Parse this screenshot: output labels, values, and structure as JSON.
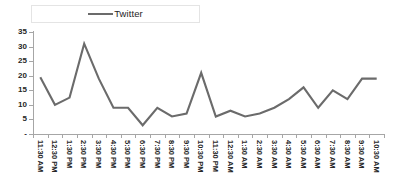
{
  "legend": {
    "entries": [
      {
        "label": "Twitter",
        "color": "#6b6b6b",
        "icon": "line-swatch-icon"
      }
    ],
    "position": "top-center",
    "border_color": "#e4e4e4"
  },
  "axes": {
    "y": {
      "ticks": [
        "35",
        "30",
        "25",
        "20",
        "15",
        "10",
        "5",
        "-"
      ],
      "min": 0,
      "max": 35,
      "step": 5
    }
  },
  "chart_data": {
    "type": "line",
    "title": "",
    "subtitle": "",
    "xlabel": "",
    "ylabel": "",
    "grid": false,
    "legend_position": "top-center",
    "ylim": [
      0,
      35
    ],
    "ytick_labels": [
      "-",
      "5",
      "10",
      "15",
      "20",
      "25",
      "30",
      "35"
    ],
    "ytick_values": [
      0,
      5,
      10,
      15,
      20,
      25,
      30,
      35
    ],
    "categories": [
      "11:30 AM",
      "12:30 PM",
      "1:30 PM",
      "2:30 PM",
      "3:30 PM",
      "4:30 PM",
      "5:30 PM",
      "6:30 PM",
      "7:30 PM",
      "8:30 PM",
      "9:30 PM",
      "10:30 PM",
      "11:30 PM",
      "12:30 AM",
      "1:30 AM",
      "2:30 AM",
      "3:30 AM",
      "4:30 AM",
      "5:30 AM",
      "6:30 AM",
      "7:30 AM",
      "8:30 AM",
      "9:30 AM",
      "10:30 AM"
    ],
    "series": [
      {
        "name": "Twitter",
        "color": "#6b6b6b",
        "values": [
          19.5,
          10,
          12.5,
          31,
          19,
          9,
          9,
          3,
          9,
          6,
          7,
          21,
          6,
          8,
          6,
          7,
          9,
          12,
          16,
          9,
          15,
          12,
          19,
          19
        ]
      }
    ]
  }
}
